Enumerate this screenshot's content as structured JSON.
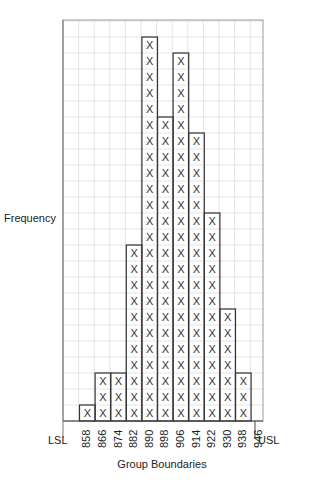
{
  "chart_data": {
    "type": "bar",
    "subtype": "tally-histogram",
    "title": "",
    "xlabel": "Group Boundaries",
    "ylabel": "Frequency",
    "tick_labels": [
      "858",
      "866",
      "874",
      "882",
      "890",
      "898",
      "906",
      "914",
      "922",
      "930",
      "938",
      "946"
    ],
    "categories": [
      "858-866",
      "866-874",
      "874-882",
      "882-890",
      "890-898",
      "898-906",
      "906-914",
      "914-922",
      "922-930",
      "930-938",
      "938-946"
    ],
    "values": [
      1,
      3,
      3,
      11,
      24,
      19,
      23,
      18,
      13,
      7,
      3
    ],
    "marker": "X",
    "spec_limits": {
      "lower": "LSL",
      "upper": "USL"
    },
    "ylim": [
      0,
      25
    ],
    "grid": true,
    "legend": null
  },
  "labels": {
    "ylabel": "Frequency",
    "xlabel": "Group Boundaries",
    "lsl": "LSL",
    "usl": "USL"
  }
}
